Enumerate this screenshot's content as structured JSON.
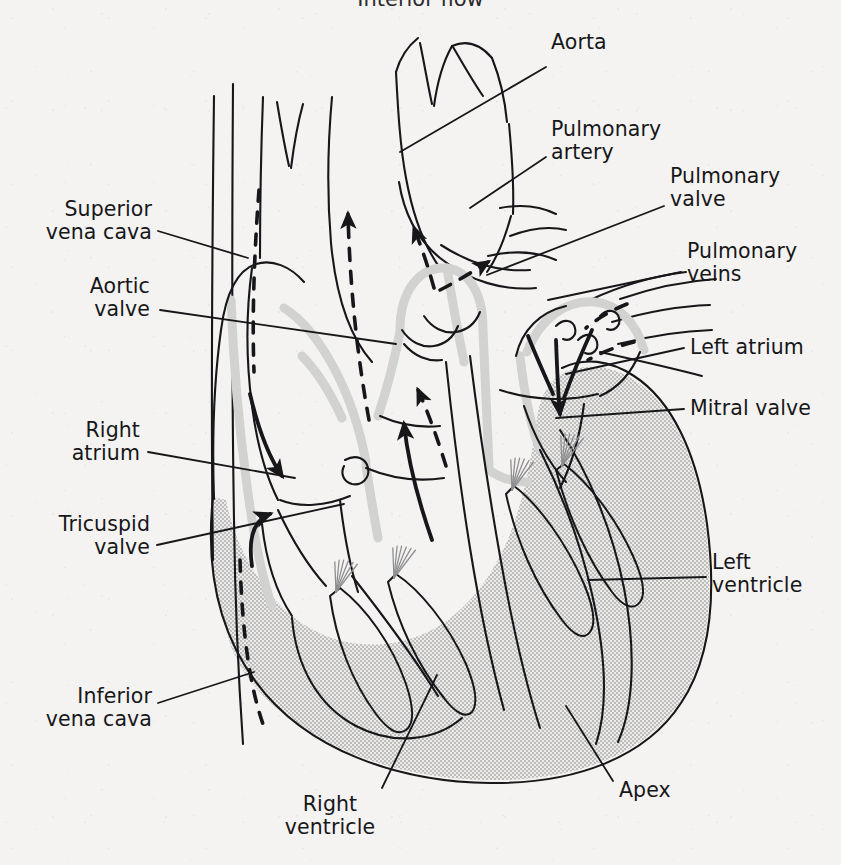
{
  "figure": {
    "title": "Interior flow",
    "caption_note": "Anatomical cross-section of the heart showing chambers, valves, great vessels and blood-flow direction arrows"
  },
  "colors": {
    "paper": "#f4f3f1",
    "ink": "#17171a",
    "muscle_shading": "#c9c9c7",
    "vessel_wall": "#cfcfcd",
    "chordae": "#8e8e90"
  },
  "labels": {
    "aorta": {
      "text": "Aorta",
      "x": 551,
      "y": 41,
      "align": "left"
    },
    "pulmonary_artery": {
      "text": "Pulmonary\nartery",
      "x": 551,
      "y": 128,
      "align": "left"
    },
    "pulmonary_valve": {
      "text": "Pulmonary\nvalve",
      "x": 670,
      "y": 175,
      "align": "left"
    },
    "pulmonary_veins": {
      "text": "Pulmonary\nveins",
      "x": 687,
      "y": 250,
      "align": "left"
    },
    "left_atrium": {
      "text": "Left atrium",
      "x": 690,
      "y": 337,
      "align": "left"
    },
    "mitral_valve": {
      "text": "Mitral valve",
      "x": 690,
      "y": 398,
      "align": "left"
    },
    "left_ventricle": {
      "text": "Left\nventricle",
      "x": 712,
      "y": 561,
      "align": "left"
    },
    "apex": {
      "text": "Apex",
      "x": 619,
      "y": 789,
      "align": "left"
    },
    "right_ventricle": {
      "text": "Right\nventricle",
      "x": 330,
      "y": 803,
      "align": "center"
    },
    "inferior_vena_cava": {
      "text": "Inferior\nvena cava",
      "x": 152,
      "y": 698,
      "align": "right"
    },
    "tricuspid_valve": {
      "text": "Tricuspid\nvalve",
      "x": 150,
      "y": 526,
      "align": "right"
    },
    "right_atrium": {
      "text": "Right\natrium",
      "x": 140,
      "y": 432,
      "align": "right"
    },
    "aortic_valve": {
      "text": "Aortic\nvalve",
      "x": 150,
      "y": 288,
      "align": "right"
    },
    "superior_vena_cava": {
      "text": "Superior\nvena cava",
      "x": 152,
      "y": 211,
      "align": "right"
    }
  },
  "structures": [
    {
      "name": "aorta",
      "kind": "great-vessel"
    },
    {
      "name": "pulmonary-artery",
      "kind": "great-vessel"
    },
    {
      "name": "pulmonary-veins",
      "kind": "great-vessel"
    },
    {
      "name": "superior-vena-cava",
      "kind": "great-vessel"
    },
    {
      "name": "inferior-vena-cava",
      "kind": "great-vessel"
    },
    {
      "name": "right-atrium",
      "kind": "chamber"
    },
    {
      "name": "left-atrium",
      "kind": "chamber"
    },
    {
      "name": "right-ventricle",
      "kind": "chamber"
    },
    {
      "name": "left-ventricle",
      "kind": "chamber"
    },
    {
      "name": "tricuspid-valve",
      "kind": "valve"
    },
    {
      "name": "mitral-valve",
      "kind": "valve"
    },
    {
      "name": "pulmonary-valve",
      "kind": "valve"
    },
    {
      "name": "aortic-valve",
      "kind": "valve"
    },
    {
      "name": "apex",
      "kind": "landmark"
    },
    {
      "name": "papillary-muscle",
      "kind": "muscle"
    },
    {
      "name": "chordae-tendineae",
      "kind": "muscle"
    }
  ],
  "flow_arrows": [
    {
      "name": "aorta-outflow",
      "style": "dashed",
      "meaning": "oxygenated blood leaving via aorta"
    },
    {
      "name": "pulmonary-artery-outflow",
      "style": "dashed",
      "meaning": "deoxygenated blood to lungs"
    },
    {
      "name": "pulmonary-vein-inflow",
      "style": "dashed",
      "meaning": "oxygenated blood from lungs"
    },
    {
      "name": "right-ventricle-outflow",
      "style": "dashed",
      "meaning": "right ventricle to pulmonary valve"
    },
    {
      "name": "vena-cava-to-right-atrium",
      "style": "solid",
      "meaning": "venous return into right atrium"
    },
    {
      "name": "right-atrium-to-ventricle",
      "style": "solid",
      "meaning": "through tricuspid valve"
    },
    {
      "name": "left-atrium-to-ventricle",
      "style": "solid",
      "meaning": "through mitral valve"
    },
    {
      "name": "left-ventricle-outflow",
      "style": "solid",
      "meaning": "to aortic valve"
    }
  ]
}
